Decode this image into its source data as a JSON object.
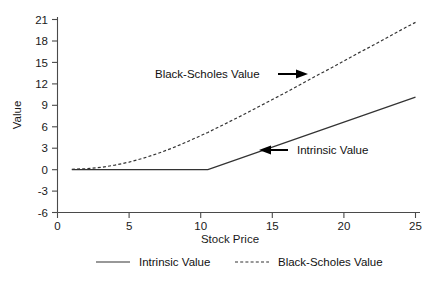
{
  "chart_data": {
    "type": "line",
    "title": "",
    "xlabel": "Stock Price",
    "ylabel": "Value",
    "xlim": [
      0,
      25.6
    ],
    "ylim": [
      -6,
      21
    ],
    "xticks": [
      "0",
      "5",
      "10",
      "15",
      "20",
      "25"
    ],
    "xtick_values": [
      0,
      5,
      10,
      15,
      20,
      25
    ],
    "yticks": [
      "21",
      "18",
      "15",
      "12",
      "9",
      "6",
      "3",
      "0",
      "-3",
      "-6"
    ],
    "ytick_values": [
      21,
      18,
      15,
      12,
      9,
      6,
      3,
      0,
      -3,
      -6
    ],
    "grid": false,
    "legend_position": "bottom",
    "x": [
      1,
      2,
      3,
      4,
      5,
      6,
      7,
      8,
      9,
      10,
      10.5,
      11,
      12,
      13,
      14,
      15,
      16,
      17,
      18,
      19,
      20,
      21,
      22,
      23,
      24,
      25
    ],
    "series": [
      {
        "name": "Intrinsic Value",
        "style": "solid",
        "color": "#333333",
        "values": [
          0,
          0,
          0,
          0,
          0,
          0,
          0,
          0,
          0,
          0,
          0,
          0.35,
          1.05,
          1.75,
          2.45,
          3.15,
          3.85,
          4.55,
          5.25,
          5.95,
          6.65,
          7.35,
          8.05,
          8.75,
          9.45,
          10.15
        ]
      },
      {
        "name": "Black-Scholes Value",
        "style": "dashed",
        "color": "#333333",
        "values": [
          0.05,
          0.12,
          0.3,
          0.62,
          1.05,
          1.6,
          2.25,
          3.0,
          3.85,
          4.75,
          5.2,
          5.7,
          6.7,
          7.7,
          8.75,
          9.8,
          10.85,
          11.95,
          13.05,
          14.1,
          15.2,
          16.3,
          17.35,
          18.45,
          19.55,
          20.6
        ]
      }
    ],
    "annotations": [
      {
        "text": "Black-Scholes Value",
        "arrow": "right"
      },
      {
        "text": "Intrinsic Value",
        "arrow": "left"
      }
    ],
    "legend": [
      {
        "label": "Intrinsic Value",
        "style": "solid"
      },
      {
        "label": "Black-Scholes Value",
        "style": "dashed"
      }
    ]
  }
}
